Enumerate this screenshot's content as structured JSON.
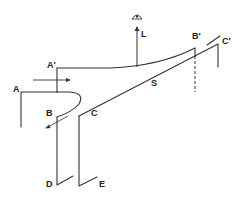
{
  "diagram": {
    "type": "schematic",
    "stroke_color": "#333333",
    "labels": {
      "A": "A",
      "A_prime": "A′",
      "B": "B",
      "B_prime": "B′",
      "C": "C",
      "C_prime": "C′",
      "D": "D",
      "E": "E",
      "S": "S",
      "L": "L"
    },
    "icons": {
      "eye": "eye-icon",
      "lift_arrow": "arrow-up-icon"
    }
  }
}
